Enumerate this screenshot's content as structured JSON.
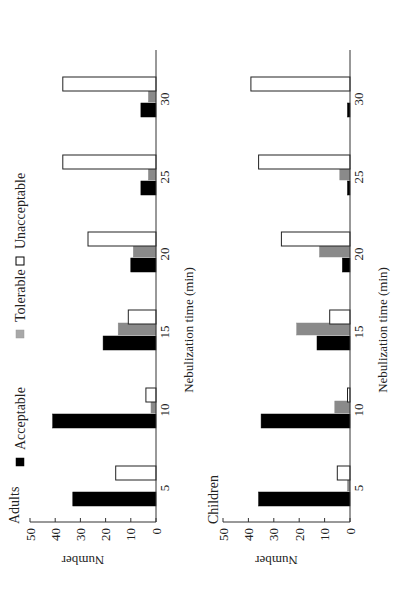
{
  "figure": {
    "legend": [
      {
        "label": "Acceptable",
        "color": "#000000",
        "stroke": "#000000"
      },
      {
        "label": "Tolerable",
        "color": "#8a8a8a",
        "stroke": "#8a8a8a"
      },
      {
        "label": "Unacceptable",
        "color": "#ffffff",
        "stroke": "#222222"
      }
    ],
    "rotation": "90deg counterclockwise"
  },
  "chart_data": [
    {
      "type": "bar",
      "title": "Adults",
      "xlabel": "Nebulization time (min)",
      "ylabel": "Number",
      "categories": [
        "5",
        "10",
        "15",
        "20",
        "25",
        "30"
      ],
      "yticks": [
        0,
        10,
        20,
        30,
        40,
        50
      ],
      "ylim": [
        0,
        50
      ],
      "grid": false,
      "legend_position": "top",
      "series": [
        {
          "name": "Acceptable",
          "values": [
            33,
            41,
            21,
            10,
            6,
            6
          ]
        },
        {
          "name": "Tolerable",
          "values": [
            0,
            2,
            15,
            9,
            3,
            3
          ]
        },
        {
          "name": "Unacceptable",
          "values": [
            16,
            4,
            11,
            27,
            37,
            37
          ]
        }
      ]
    },
    {
      "type": "bar",
      "title": "Children",
      "xlabel": "Nebulization time (min)",
      "ylabel": "Number",
      "categories": [
        "5",
        "10",
        "15",
        "20",
        "25",
        "30"
      ],
      "yticks": [
        0,
        10,
        20,
        30,
        40,
        50
      ],
      "ylim": [
        0,
        50
      ],
      "grid": false,
      "series": [
        {
          "name": "Acceptable",
          "values": [
            36,
            35,
            13,
            3,
            1,
            1
          ]
        },
        {
          "name": "Tolerable",
          "values": [
            1,
            6,
            21,
            12,
            4,
            0
          ]
        },
        {
          "name": "Unacceptable",
          "values": [
            5,
            1,
            8,
            27,
            36,
            39
          ]
        }
      ]
    }
  ]
}
